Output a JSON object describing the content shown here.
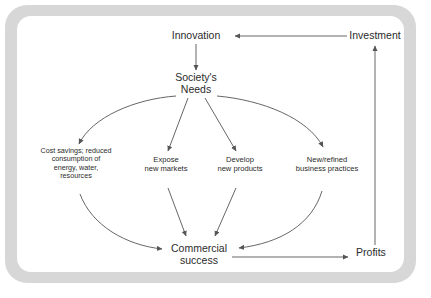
{
  "figure": {
    "type": "flow-diagram",
    "background_color": "#ffffff",
    "frame_color": "#d7d7d7",
    "panel_color": "#ffffff",
    "line_color": "#555555",
    "text_color": "#2b2b2b"
  },
  "nodes": {
    "innovation": {
      "label": "Innovation",
      "x": 196,
      "y": 36
    },
    "investment": {
      "label": "Investment",
      "x": 375,
      "y": 36
    },
    "societys_needs": {
      "label": "Society's\nNeeds",
      "x": 196,
      "y": 85
    },
    "cost_savings": {
      "label": "Cost savings; reduced\nconsumption of\nenergy, water,\nresources",
      "x": 76,
      "y": 168
    },
    "expose_markets": {
      "label": "Expose\nnew markets",
      "x": 166,
      "y": 170
    },
    "develop_products": {
      "label": "Develop\nnew products",
      "x": 240,
      "y": 170
    },
    "business_practices": {
      "label": "New/refined\nbusiness practices",
      "x": 327,
      "y": 170
    },
    "commercial_success": {
      "label": "Commercial\nsuccess",
      "x": 199,
      "y": 249
    },
    "profits": {
      "label": "Profits",
      "x": 371,
      "y": 253
    }
  },
  "edges": [
    {
      "from": "investment",
      "to": "innovation",
      "style": "straight-horizontal-left"
    },
    {
      "from": "innovation",
      "to": "societys_needs",
      "style": "straight-vertical-down"
    },
    {
      "from": "societys_needs",
      "to": "cost_savings",
      "style": "curve-down-left"
    },
    {
      "from": "societys_needs",
      "to": "expose_markets",
      "style": "straight-diagonal"
    },
    {
      "from": "societys_needs",
      "to": "develop_products",
      "style": "straight-diagonal"
    },
    {
      "from": "societys_needs",
      "to": "business_practices",
      "style": "curve-down-right"
    },
    {
      "from": "cost_savings",
      "to": "commercial_success",
      "style": "curve-down-right"
    },
    {
      "from": "expose_markets",
      "to": "commercial_success",
      "style": "straight-diagonal"
    },
    {
      "from": "develop_products",
      "to": "commercial_success",
      "style": "straight-diagonal"
    },
    {
      "from": "business_practices",
      "to": "commercial_success",
      "style": "curve-down-left"
    },
    {
      "from": "commercial_success",
      "to": "profits",
      "style": "straight-horizontal-right"
    },
    {
      "from": "profits",
      "to": "investment",
      "style": "straight-vertical-up"
    }
  ]
}
